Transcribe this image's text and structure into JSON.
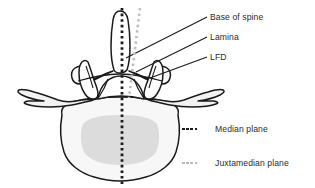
{
  "figure": {
    "background_color": "#ffffff"
  },
  "annotations": {
    "base_of_spine": "Base of spine",
    "lamina": "Lamina",
    "lfd": "LFD"
  },
  "legend": {
    "items": [
      {
        "label": "Median plane",
        "color": "#1c1c1c",
        "style": "dotted",
        "dot_count": 4
      },
      {
        "label": "Juxtamedian plane",
        "color": "#b9b9b9",
        "style": "dotted",
        "dot_count": 4
      }
    ]
  },
  "diagram": {
    "outline_color": "#1a1a1a",
    "body_fill": "#f7f7f7",
    "inner_fill": "#dcdcdc",
    "median_plane_color": "#1c1c1c",
    "juxtamedian_plane_color": "#bdbdbd",
    "leader_line_color": "#1a1a1a",
    "structures": [
      "spinous process",
      "lamina",
      "superior articular process",
      "transverse process left",
      "transverse process right",
      "pedicle",
      "vertebral body",
      "vertebral foramen"
    ]
  }
}
